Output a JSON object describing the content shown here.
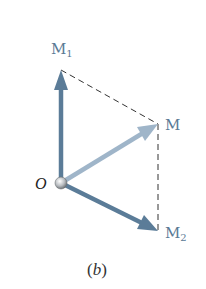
{
  "figure": {
    "caption_open": "(",
    "caption_letter": "b",
    "caption_close": ")",
    "origin_label": "O",
    "vectors": [
      {
        "id": "M1",
        "label": "M",
        "subscript": "1",
        "from": [
          61,
          183
        ],
        "to": [
          61,
          70
        ],
        "color": "#5b7c98"
      },
      {
        "id": "M",
        "label": "M",
        "subscript": "",
        "from": [
          61,
          183
        ],
        "to": [
          158,
          124
        ],
        "color": "#9fb5c9"
      },
      {
        "id": "M2",
        "label": "M",
        "subscript": "2",
        "from": [
          61,
          183
        ],
        "to": [
          158,
          231
        ],
        "color": "#5b7c98"
      }
    ],
    "dashed_lines": [
      {
        "from": [
          61,
          70
        ],
        "to": [
          158,
          124
        ]
      },
      {
        "from": [
          158,
          124
        ],
        "to": [
          158,
          231
        ]
      }
    ],
    "colors": {
      "vector_dark": "#5b7c98",
      "vector_light": "#9fb5c9",
      "label": "#5a7a95",
      "dashed": "#333333"
    }
  }
}
